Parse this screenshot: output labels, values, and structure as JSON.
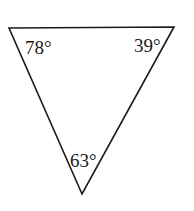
{
  "diagram": {
    "shape": "triangle",
    "orientation": "inverted",
    "vertices": {
      "top_left": {
        "x": 9,
        "y": 28
      },
      "top_right": {
        "x": 174,
        "y": 27
      },
      "bottom": {
        "x": 82,
        "y": 194
      }
    },
    "angles": {
      "top_left": "78°",
      "top_right": "39°",
      "bottom": "63°"
    },
    "stroke_color": "#1a1a1a",
    "background": "#ffffff"
  }
}
